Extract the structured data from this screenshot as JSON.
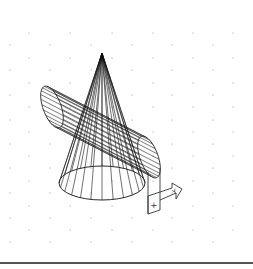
{
  "viewport": {
    "background": "#ffffff",
    "grid": {
      "dot_color": "#b8b8b8",
      "rows": [
        {
          "y": 33,
          "xs": [
            29,
            70,
            112,
            153,
            193,
            233
          ]
        },
        {
          "y": 45,
          "xs": [
            10,
            50,
            91,
            132,
            172,
            213
          ]
        },
        {
          "y": 58,
          "xs": [
            29,
            70,
            112,
            153,
            193,
            233
          ]
        },
        {
          "y": 70,
          "xs": [
            10,
            50,
            91,
            132,
            172,
            213
          ]
        },
        {
          "y": 83,
          "xs": [
            29,
            70,
            112,
            153,
            193,
            233
          ]
        },
        {
          "y": 95,
          "xs": [
            10,
            50,
            91,
            132,
            172,
            213
          ]
        },
        {
          "y": 107,
          "xs": [
            29,
            70,
            112,
            153,
            193,
            233
          ]
        },
        {
          "y": 120,
          "xs": [
            10,
            50,
            91,
            132,
            172,
            213
          ]
        },
        {
          "y": 132,
          "xs": [
            29,
            70,
            112,
            153,
            193,
            233
          ]
        },
        {
          "y": 144,
          "xs": [
            10,
            50,
            91,
            132,
            172,
            213
          ]
        },
        {
          "y": 156,
          "xs": [
            29,
            70,
            112,
            153,
            193,
            233
          ]
        },
        {
          "y": 168,
          "xs": [
            10,
            50,
            91,
            132,
            172,
            213
          ]
        },
        {
          "y": 181,
          "xs": [
            29,
            70,
            112,
            153,
            193,
            233
          ]
        },
        {
          "y": 193,
          "xs": [
            10,
            50,
            91,
            132,
            172,
            213
          ]
        },
        {
          "y": 206,
          "xs": [
            29,
            70,
            112,
            153,
            193,
            233
          ]
        },
        {
          "y": 218,
          "xs": [
            10,
            50,
            91,
            132,
            172,
            213
          ]
        },
        {
          "y": 230,
          "xs": [
            29,
            70,
            112,
            153,
            193,
            233
          ]
        },
        {
          "y": 242,
          "xs": [
            10,
            50,
            91,
            132,
            172,
            213
          ]
        }
      ]
    },
    "cone": {
      "apex": [
        102,
        53
      ],
      "base_center": [
        102,
        183
      ],
      "base_rx": 43,
      "base_ry": 17,
      "color": "#111111"
    },
    "cylinder": {
      "end1_center": [
        52,
        107
      ],
      "end2_center": [
        149,
        157
      ],
      "rx": 9,
      "ry": 22,
      "color": "#222222"
    },
    "ucs_icon": {
      "y_label": "Y",
      "plus_label": "+",
      "color": "#333333"
    }
  },
  "command_line": {
    "text": "",
    "divider_color": "#555555"
  }
}
